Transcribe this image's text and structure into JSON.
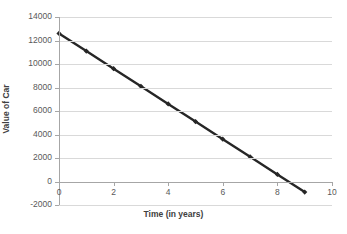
{
  "chart_data": {
    "type": "line",
    "title": "",
    "xlabel": "Time (in years)",
    "ylabel": "Value of Car",
    "xlim": [
      0,
      10
    ],
    "ylim": [
      -2000,
      14000
    ],
    "xticks": [
      0,
      2,
      4,
      6,
      8,
      10
    ],
    "xtick_labels": [
      "0",
      "2",
      "4",
      "6",
      "8",
      "10"
    ],
    "yticks": [
      14000,
      12000,
      10000,
      8000,
      6000,
      4000,
      2000,
      0,
      -2000
    ],
    "ytick_labels": [
      "14000",
      "12000",
      "10000",
      "8000",
      "6000",
      "4000",
      "2000",
      "0",
      "-2000"
    ],
    "grid": "horizontal",
    "legend": "none",
    "series": [
      {
        "name": "Value of Car",
        "color": "#262626",
        "marker": "diamond",
        "x": [
          0,
          1,
          2,
          3,
          4,
          5,
          6,
          7,
          8,
          9
        ],
        "values": [
          12600,
          11100,
          9600,
          8100,
          6600,
          5100,
          3600,
          2100,
          600,
          -900
        ]
      }
    ]
  },
  "axes": {
    "x_title": "Time (in years)",
    "y_title": "Value of Car"
  }
}
